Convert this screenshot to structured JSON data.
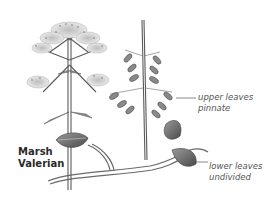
{
  "figure": {
    "title_line1": "Marsh",
    "title_line2": "Valerian",
    "annotations": [
      {
        "line1": "upper leaves",
        "line2": "pinnate"
      },
      {
        "line1": "lower leaves",
        "line2": "undivided"
      }
    ],
    "colors": {
      "background": "#ffffff",
      "ink": "#4a4a4a",
      "leaf_fill": "#8a8a8a",
      "label_text": "#555555",
      "title_text": "#2a2a2a"
    }
  }
}
